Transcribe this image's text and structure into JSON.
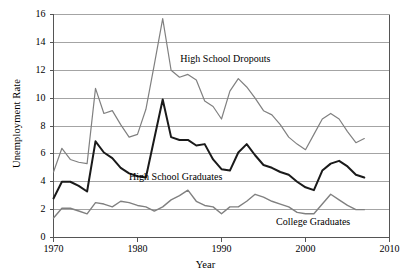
{
  "chart_data": {
    "type": "line",
    "title": "",
    "xlabel": "Year",
    "ylabel": "Unemployment Rate",
    "xlim": [
      1970,
      2010
    ],
    "ylim": [
      0,
      16
    ],
    "xticks": [
      1970,
      1980,
      1990,
      2000,
      2010
    ],
    "yticks": [
      0,
      2,
      4,
      6,
      8,
      10,
      12,
      14,
      16
    ],
    "grid": "horizontal",
    "legend_position": "inline-annotations",
    "x": [
      1970,
      1971,
      1972,
      1973,
      1974,
      1975,
      1976,
      1977,
      1978,
      1979,
      1980,
      1981,
      1982,
      1983,
      1984,
      1985,
      1986,
      1987,
      1988,
      1989,
      1990,
      1991,
      1992,
      1993,
      1994,
      1995,
      1996,
      1997,
      1998,
      1999,
      2000,
      2001,
      2002,
      2003,
      2004,
      2005,
      2006,
      2007
    ],
    "series": [
      {
        "name": "High School Dropouts",
        "color": "#808080",
        "width": 1.2,
        "values": [
          4.7,
          6.4,
          5.6,
          5.4,
          5.3,
          10.7,
          8.9,
          9.1,
          8.1,
          7.2,
          7.4,
          9.2,
          12.4,
          15.7,
          12.0,
          11.5,
          11.7,
          11.3,
          9.8,
          9.4,
          8.5,
          10.5,
          11.4,
          10.8,
          10.0,
          9.1,
          8.8,
          8.1,
          7.2,
          6.7,
          6.3,
          7.4,
          8.5,
          8.9,
          8.5,
          7.6,
          6.8,
          7.1
        ]
      },
      {
        "name": "High School Graduates",
        "color": "#1a1a1a",
        "width": 2.0,
        "values": [
          2.8,
          4.0,
          4.0,
          3.7,
          3.3,
          6.9,
          6.1,
          5.7,
          5.0,
          4.6,
          4.4,
          4.3,
          7.1,
          9.9,
          7.2,
          7.0,
          7.0,
          6.6,
          6.7,
          5.6,
          4.9,
          4.8,
          6.1,
          6.7,
          5.9,
          5.2,
          5.0,
          4.7,
          4.5,
          4.0,
          3.6,
          3.4,
          4.8,
          5.3,
          5.5,
          5.1,
          4.5,
          4.3
        ]
      },
      {
        "name": "College Graduates",
        "color": "#808080",
        "width": 1.4,
        "values": [
          1.4,
          2.1,
          2.1,
          1.9,
          1.7,
          2.5,
          2.4,
          2.2,
          2.6,
          2.5,
          2.3,
          2.2,
          1.9,
          2.2,
          2.7,
          3.0,
          3.4,
          2.6,
          2.3,
          2.2,
          1.7,
          2.2,
          2.2,
          2.6,
          3.1,
          2.9,
          2.6,
          2.4,
          2.2,
          1.8,
          1.7,
          1.7,
          2.4,
          3.1,
          2.7,
          2.3,
          2.0,
          2.0
        ]
      }
    ],
    "annotations": [
      {
        "text": "High School Dropouts",
        "x": 1985.1,
        "y": 12.8
      },
      {
        "text": "High School Graduates",
        "x": 1979.0,
        "y": 4.35
      },
      {
        "text": "College Graduates",
        "x": 1996.5,
        "y": 1.1
      }
    ]
  },
  "axis": {
    "ylabel": "Unemployment Rate",
    "xlabel": "Year",
    "yticks": [
      "0",
      "2",
      "4",
      "6",
      "8",
      "10",
      "12",
      "14",
      "16"
    ],
    "xticks": [
      "1970",
      "1980",
      "1990",
      "2000",
      "2010"
    ]
  },
  "colors": {
    "gridline": "#9a9a9a",
    "axis": "#555555",
    "dropouts": "#808080",
    "graduates": "#1a1a1a",
    "college": "#808080",
    "text": "#000000",
    "background": "#ffffff"
  }
}
